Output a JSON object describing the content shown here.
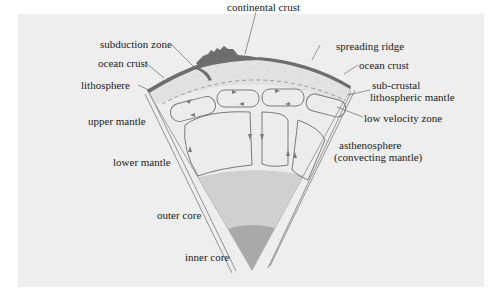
{
  "colors": {
    "panel_background": "#eeeeee",
    "crust": "#6e6e6e",
    "lithosphere": "#e0e0e0",
    "mantle": "#ececec",
    "outer_core": "#cfcfcf",
    "inner_core": "#a8a8a8",
    "line": "#777777"
  },
  "labels": {
    "continental_crust": "continental crust",
    "subduction_zone": "subduction zone",
    "ocean_crust_left": "ocean crust",
    "lithosphere": "lithosphere",
    "upper_mantle": "upper mantle",
    "lower_mantle": "lower mantle",
    "outer_core": "outer core",
    "inner_core": "inner core",
    "spreading_ridge": "spreading ridge",
    "ocean_crust_right": "ocean crust",
    "sub_crustal_line1": "sub-crustal",
    "sub_crustal_line2": "lithospheric mantle",
    "low_velocity_zone": "low velocity zone",
    "asthenosphere_line1": "asthenosphere",
    "asthenosphere_line2": "(convecting mantle)"
  }
}
